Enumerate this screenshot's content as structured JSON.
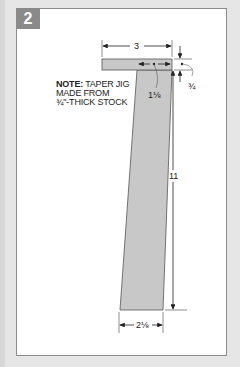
{
  "figure": {
    "number": "2",
    "note": {
      "label": "NOTE:",
      "lines": [
        "TAPER JIG",
        "MADE FROM",
        "¾\"-THICK STOCK"
      ]
    },
    "dimensions": {
      "top_width": "3",
      "notch_width": "1⅛",
      "thickness": "¾",
      "length": "11",
      "bottom_width": "2⅛"
    }
  },
  "colors": {
    "background": "#e6e6e6",
    "panel": "#ffffff",
    "badge": "#8a8a8a",
    "jig_fill": "#c8c8c8",
    "line": "#222222"
  }
}
